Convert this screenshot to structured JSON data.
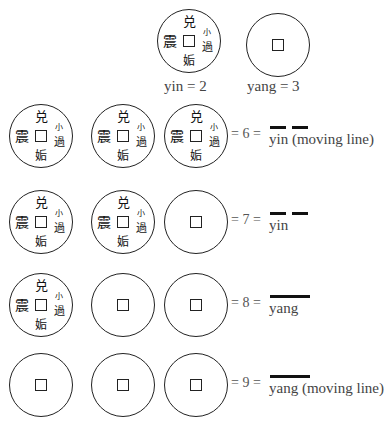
{
  "legend": [
    {
      "face": "yin",
      "label": "yin = 2"
    },
    {
      "face": "yang",
      "label": "yang = 3"
    }
  ],
  "coin_characters": {
    "top": "兑",
    "left": "震",
    "bottom": "姤",
    "right_top": "小",
    "right_bottom": "過"
  },
  "rows": [
    {
      "coins": [
        "yin",
        "yin",
        "yin"
      ],
      "equation": "= 6 =",
      "line": "broken",
      "description": "yin (moving line)"
    },
    {
      "coins": [
        "yin",
        "yin",
        "yang"
      ],
      "equation": "= 7 =",
      "line": "broken",
      "description": "yin"
    },
    {
      "coins": [
        "yin",
        "yang",
        "yang"
      ],
      "equation": "= 8 =",
      "line": "solid",
      "description": "yang"
    },
    {
      "coins": [
        "yang",
        "yang",
        "yang"
      ],
      "equation": "= 9 =",
      "line": "solid",
      "description": "yang (moving line)"
    }
  ]
}
